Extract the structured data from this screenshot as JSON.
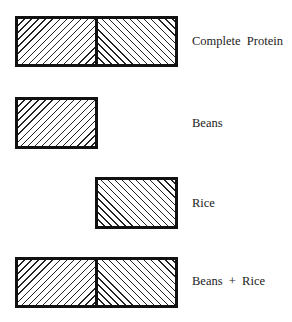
{
  "diagram": {
    "rows": [
      {
        "label": "Complete  Protein",
        "parts": [
          "beans",
          "rice"
        ]
      },
      {
        "label": "Beans",
        "parts": [
          "beans"
        ]
      },
      {
        "label": "Rice",
        "parts": [
          "rice"
        ]
      },
      {
        "label": "Beans  +  Rice",
        "parts": [
          "beans",
          "rice"
        ]
      }
    ],
    "legend": {
      "beans": "forward diagonal hatch (left half)",
      "rice": "backward diagonal hatch (right half)"
    }
  }
}
